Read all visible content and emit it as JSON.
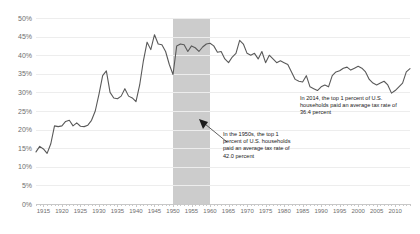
{
  "chart_data": {
    "type": "line",
    "title": "",
    "xlabel": "",
    "ylabel": "",
    "xlim": [
      1913,
      2014
    ],
    "ylim": [
      0,
      50
    ],
    "ytick_labels": [
      "0%",
      "5%",
      "10%",
      "15%",
      "20%",
      "25%",
      "30%",
      "35%",
      "40%",
      "45%",
      "50%"
    ],
    "ytick_values": [
      0,
      5,
      10,
      15,
      20,
      25,
      30,
      35,
      40,
      45,
      50
    ],
    "xtick_labels": [
      "1915",
      "1920",
      "1925",
      "1930",
      "1935",
      "1940",
      "1945",
      "1950",
      "1955",
      "1960",
      "1965",
      "1970",
      "1975",
      "1980",
      "1985",
      "1990",
      "1995",
      "2000",
      "2005",
      "2010"
    ],
    "xtick_values": [
      1915,
      1920,
      1925,
      1930,
      1935,
      1940,
      1945,
      1950,
      1955,
      1960,
      1965,
      1970,
      1975,
      1980,
      1985,
      1990,
      1995,
      2000,
      2005,
      2010
    ],
    "grid": "horizontal",
    "legend": "none",
    "line_color": "#595959",
    "band_color": "#c9c9c9",
    "highlight_band": {
      "label": "1950s",
      "start": 1950,
      "end": 1960
    },
    "series": [
      {
        "name": "Average tax rate, top 1 percent of U.S. households",
        "x": [
          1913,
          1914,
          1915,
          1916,
          1917,
          1918,
          1919,
          1920,
          1921,
          1922,
          1923,
          1924,
          1925,
          1926,
          1927,
          1928,
          1929,
          1930,
          1931,
          1932,
          1933,
          1934,
          1935,
          1936,
          1937,
          1938,
          1939,
          1940,
          1941,
          1942,
          1943,
          1944,
          1945,
          1946,
          1947,
          1948,
          1949,
          1950,
          1951,
          1952,
          1953,
          1954,
          1955,
          1956,
          1957,
          1958,
          1959,
          1960,
          1961,
          1962,
          1963,
          1964,
          1965,
          1966,
          1967,
          1968,
          1969,
          1970,
          1971,
          1972,
          1973,
          1974,
          1975,
          1976,
          1977,
          1978,
          1979,
          1980,
          1981,
          1982,
          1983,
          1984,
          1985,
          1986,
          1987,
          1988,
          1989,
          1990,
          1991,
          1992,
          1993,
          1994,
          1995,
          1996,
          1997,
          1998,
          1999,
          2000,
          2001,
          2002,
          2003,
          2004,
          2005,
          2006,
          2007,
          2008,
          2009,
          2010,
          2011,
          2012,
          2013,
          2014
        ],
        "values": [
          14.0,
          15.5,
          14.8,
          13.6,
          16.2,
          21.0,
          20.8,
          21.0,
          22.2,
          22.5,
          21.0,
          21.8,
          20.9,
          20.8,
          21.2,
          22.5,
          25.0,
          29.5,
          34.5,
          35.8,
          30.0,
          28.5,
          28.3,
          29.0,
          31.0,
          29.0,
          28.5,
          27.5,
          32.0,
          38.5,
          43.5,
          41.5,
          45.5,
          43.0,
          42.8,
          41.0,
          37.5,
          34.8,
          42.5,
          43.0,
          42.8,
          41.0,
          42.5,
          42.0,
          41.0,
          42.2,
          43.0,
          43.2,
          42.5,
          40.8,
          41.0,
          39.0,
          38.0,
          39.5,
          40.5,
          44.0,
          43.0,
          40.5,
          40.0,
          40.5,
          39.0,
          41.0,
          38.0,
          40.0,
          39.0,
          38.0,
          38.5,
          38.0,
          37.5,
          35.5,
          33.5,
          33.0,
          32.8,
          34.5,
          31.5,
          31.0,
          30.5,
          31.5,
          32.0,
          31.5,
          34.5,
          35.5,
          35.8,
          36.5,
          36.8,
          36.0,
          36.5,
          37.0,
          36.5,
          35.5,
          33.5,
          32.5,
          32.0,
          32.5,
          33.0,
          32.0,
          29.8,
          30.5,
          31.5,
          32.5,
          35.5,
          36.4
        ]
      }
    ],
    "annotations": [
      {
        "id": "1950s-note",
        "text": "In the 1950s, the top 1 percent of U.S. households paid an average tax rate of 42.0 percent",
        "points_to": "1950s shaded band"
      },
      {
        "id": "2014-note",
        "text": "In 2014, the top 1 percent of U.S. households paid an average tax rate of 36.4 percent",
        "points_to": "2014 end of line"
      }
    ]
  }
}
